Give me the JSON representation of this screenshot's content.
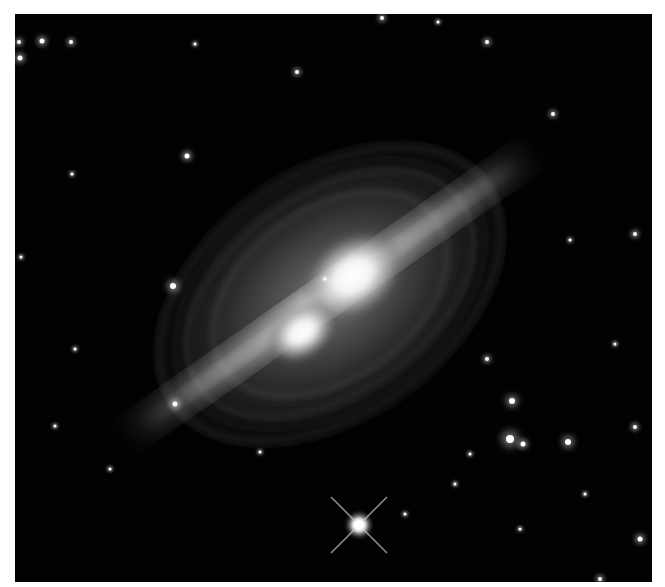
{
  "image": {
    "subject": "bipolar nebula with bright central lobes and concentric arcs",
    "colors": {
      "background": "#020202",
      "border": "#ffffff",
      "glow": "#ffffff"
    },
    "stars": [
      {
        "x": 27,
        "y": 27,
        "r": 2.5
      },
      {
        "x": 56,
        "y": 28,
        "r": 2
      },
      {
        "x": 5,
        "y": 44,
        "r": 2.5
      },
      {
        "x": 4,
        "y": 28,
        "r": 2
      },
      {
        "x": 367,
        "y": 4,
        "r": 2
      },
      {
        "x": 423,
        "y": 8,
        "r": 1.5
      },
      {
        "x": 472,
        "y": 28,
        "r": 2
      },
      {
        "x": 282,
        "y": 58,
        "r": 2
      },
      {
        "x": 172,
        "y": 142,
        "r": 2.5
      },
      {
        "x": 57,
        "y": 160,
        "r": 1.5
      },
      {
        "x": 158,
        "y": 272,
        "r": 3
      },
      {
        "x": 180,
        "y": 30,
        "r": 1.5
      },
      {
        "x": 538,
        "y": 100,
        "r": 2
      },
      {
        "x": 555,
        "y": 226,
        "r": 1.5
      },
      {
        "x": 620,
        "y": 220,
        "r": 2
      },
      {
        "x": 472,
        "y": 345,
        "r": 2
      },
      {
        "x": 497,
        "y": 387,
        "r": 3
      },
      {
        "x": 495,
        "y": 425,
        "r": 4
      },
      {
        "x": 508,
        "y": 430,
        "r": 2.5
      },
      {
        "x": 553,
        "y": 428,
        "r": 3
      },
      {
        "x": 620,
        "y": 413,
        "r": 2
      },
      {
        "x": 160,
        "y": 390,
        "r": 2.5
      },
      {
        "x": 60,
        "y": 335,
        "r": 1.5
      },
      {
        "x": 40,
        "y": 412,
        "r": 1.5
      },
      {
        "x": 245,
        "y": 438,
        "r": 1.5
      },
      {
        "x": 455,
        "y": 440,
        "r": 1.5
      },
      {
        "x": 570,
        "y": 480,
        "r": 1.5
      },
      {
        "x": 625,
        "y": 525,
        "r": 2.5
      },
      {
        "x": 585,
        "y": 565,
        "r": 2
      },
      {
        "x": 390,
        "y": 500,
        "r": 1.5
      },
      {
        "x": 95,
        "y": 455,
        "r": 1.5
      },
      {
        "x": 310,
        "y": 265,
        "r": 1.5
      },
      {
        "x": 6,
        "y": 243,
        "r": 1.5
      },
      {
        "x": 600,
        "y": 330,
        "r": 1.5
      },
      {
        "x": 440,
        "y": 470,
        "r": 1.5
      },
      {
        "x": 505,
        "y": 515,
        "r": 1.5
      }
    ],
    "bright_star": {
      "x": 344,
      "y": 511
    }
  }
}
